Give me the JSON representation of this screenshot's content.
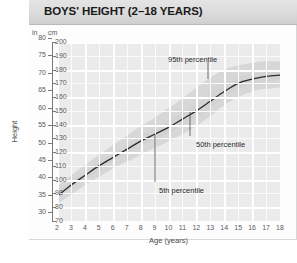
{
  "header": {
    "title": "BOYS' HEIGHT (2–18 YEARS)"
  },
  "chart_data": {
    "type": "line",
    "title": "BOYS' HEIGHT (2–18 YEARS)",
    "xlabel": "Age (years)",
    "ylabel": "Height",
    "grid": true,
    "legend": "none",
    "annotations_position": "inside-plot",
    "x": [
      2,
      3,
      4,
      5,
      6,
      7,
      8,
      9,
      10,
      11,
      12,
      13,
      14,
      15,
      16,
      17,
      18
    ],
    "xticklabels": [
      "2",
      "3",
      "4",
      "5",
      "6",
      "7",
      "8",
      "9",
      "10",
      "11",
      "12",
      "13",
      "14",
      "15",
      "16",
      "17",
      "18"
    ],
    "xlim": [
      2,
      18
    ],
    "y_left_unit": "in",
    "y_right_unit": "cm",
    "yticklabels_in": [
      "80",
      "75",
      "70",
      "65",
      "60",
      "55",
      "50",
      "45",
      "40",
      "35",
      "30"
    ],
    "yticks_in": [
      80,
      75,
      70,
      65,
      60,
      55,
      50,
      45,
      40,
      35,
      30
    ],
    "yticklabels_cm": [
      "200",
      "190",
      "180",
      "170",
      "160",
      "150",
      "140",
      "130",
      "120",
      "110",
      "100",
      "90",
      "80",
      "70"
    ],
    "yticks_cm": [
      200,
      190,
      180,
      170,
      160,
      150,
      140,
      130,
      120,
      110,
      100,
      90,
      80,
      70
    ],
    "ylim_cm": [
      70,
      200
    ],
    "series": [
      {
        "name": "50th percentile",
        "unit": "cm",
        "values": [
          88,
          96,
          103,
          110,
          116,
          122,
          128,
          133,
          138,
          144,
          150,
          157,
          164,
          170,
          173,
          175,
          176
        ]
      },
      {
        "name": "95th percentile",
        "unit": "cm",
        "values": [
          95,
          103,
          111,
          118,
          125,
          132,
          139,
          145,
          152,
          159,
          167,
          174,
          180,
          183,
          185,
          186,
          186
        ]
      },
      {
        "name": "5th percentile",
        "unit": "cm",
        "values": [
          82,
          89,
          96,
          102,
          108,
          113,
          118,
          123,
          128,
          133,
          139,
          146,
          154,
          160,
          164,
          166,
          167
        ]
      }
    ],
    "annotations": [
      {
        "label": "95th percentile",
        "target_age": 14.2,
        "target_cm": 181
      },
      {
        "label": "50th percentile",
        "target_age": 12.6,
        "target_cm": 155
      },
      {
        "label": "5th percentile",
        "target_age": 10.5,
        "target_cm": 131
      }
    ]
  }
}
